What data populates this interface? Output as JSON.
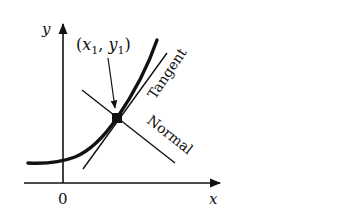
{
  "diagram": {
    "axes": {
      "x_label": "x",
      "y_label": "y",
      "origin_label": "0"
    },
    "point": {
      "label_open": "(",
      "x_var": "x",
      "x_sub": "1",
      "comma": ", ",
      "y_var": "y",
      "y_sub": "1",
      "label_close": ")"
    },
    "lines": {
      "tangent_label": "Tangent",
      "normal_label": "Normal"
    },
    "colors": {
      "ink": "#111111",
      "background": "#ffffff"
    }
  }
}
